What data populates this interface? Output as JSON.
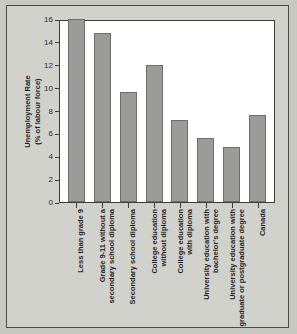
{
  "chart_data": {
    "type": "bar",
    "title": "",
    "xlabel": "",
    "ylabel": "Unemployment Rate\n(% of labour force)",
    "ylabel_line1": "Unemployment Rate",
    "ylabel_line2": "(% of labour force)",
    "ylim": [
      0,
      16
    ],
    "yticks": [
      "0",
      "2",
      "4",
      "6",
      "8",
      "10",
      "12",
      "14",
      "16"
    ],
    "ytick_values": [
      0,
      2,
      4,
      6,
      8,
      10,
      12,
      14,
      16
    ],
    "grid": false,
    "legend": false,
    "bar_color": "#9b9b99",
    "bar_border_color": "#6d6d6b",
    "plot_background": "#ffffff",
    "figure_background": "#d2d2cd",
    "frame_color": "#3c3c3a",
    "categories": [
      "Less than grade 9",
      "Grade 9-11 without a secondary school diploma",
      "Secondary school diploma",
      "College education without diploma",
      "College education with diploma",
      "University education with bachelor's degree",
      "University education with graduate or postgraduate degree",
      "Canada"
    ],
    "category_lines": [
      [
        "Less than grade 9"
      ],
      [
        "Grade 9-11 without a",
        "secondary school diploma"
      ],
      [
        "Secondary school diploma"
      ],
      [
        "College education",
        "without diploma"
      ],
      [
        "College education",
        "with diploma"
      ],
      [
        "University education with",
        "bachelor's degree"
      ],
      [
        "University education with",
        "graduate or postgraduate degree"
      ],
      [
        "Canada"
      ]
    ],
    "values": [
      16.0,
      14.8,
      9.6,
      12.0,
      7.2,
      5.6,
      4.8,
      7.6
    ]
  }
}
